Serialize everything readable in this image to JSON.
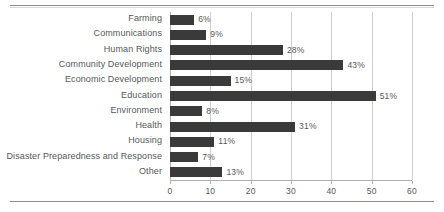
{
  "chart_data": {
    "type": "bar",
    "orientation": "horizontal",
    "title": "",
    "xlabel": "",
    "ylabel": "",
    "categories": [
      "Farming",
      "Communications",
      "Human Rights",
      "Community Development",
      "Economic Development",
      "Education",
      "Environment",
      "Health",
      "Housing",
      "Disaster Preparedness and Response",
      "Other"
    ],
    "values": [
      6,
      9,
      28,
      43,
      15,
      51,
      8,
      31,
      11,
      7,
      13
    ],
    "data_labels": [
      "6%",
      "9%",
      "28%",
      "43%",
      "15%",
      "51%",
      "8%",
      "31%",
      "11%",
      "7%",
      "13%"
    ],
    "xlim": [
      0,
      60
    ],
    "xticks": [
      0,
      10,
      20,
      30,
      40,
      50,
      60
    ],
    "xtick_labels": [
      "0",
      "10",
      "20",
      "30",
      "40",
      "50",
      "60"
    ],
    "grid": "vertical",
    "legend": null,
    "bar_color": "#3a3a3a",
    "text_color": "#55585a",
    "gridline_color": "#cfcfcf",
    "background": "#ffffff"
  }
}
